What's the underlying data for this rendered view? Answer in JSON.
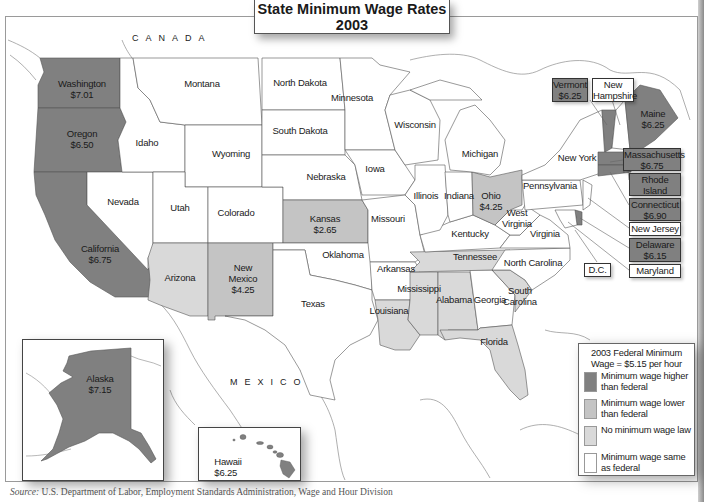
{
  "title": {
    "line1": "State Minimum Wage Rates",
    "line2": "2003"
  },
  "countries": {
    "canada": "CANADA",
    "mexico": "MEXICO"
  },
  "legend": {
    "heading_line1": "2003 Federal Minimum",
    "heading_line2": "Wage = $5.15 per hour",
    "items": [
      {
        "key": "higher",
        "label": "Minimum wage higher than federal",
        "color": "#808080"
      },
      {
        "key": "lower",
        "label": "Minimum wage lower than federal",
        "color": "#c4c4c4"
      },
      {
        "key": "none",
        "label": "No minimum wage law",
        "color": "#d9d9d9"
      },
      {
        "key": "same",
        "label": "Minimum wage same as federal",
        "color": "#ffffff"
      }
    ]
  },
  "states": [
    {
      "name": "Washington",
      "wage": "$7.01",
      "category": "higher"
    },
    {
      "name": "Oregon",
      "wage": "$6.50",
      "category": "higher"
    },
    {
      "name": "California",
      "wage": "$6.75",
      "category": "higher"
    },
    {
      "name": "Nevada",
      "wage": "",
      "category": "same"
    },
    {
      "name": "Idaho",
      "wage": "",
      "category": "same"
    },
    {
      "name": "Montana",
      "wage": "",
      "category": "same"
    },
    {
      "name": "Wyoming",
      "wage": "",
      "category": "same"
    },
    {
      "name": "Utah",
      "wage": "",
      "category": "same"
    },
    {
      "name": "Colorado",
      "wage": "",
      "category": "same"
    },
    {
      "name": "Arizona",
      "wage": "",
      "category": "none"
    },
    {
      "name": "New Mexico",
      "wage": "$4.25",
      "category": "lower"
    },
    {
      "name": "North Dakota",
      "wage": "",
      "category": "same"
    },
    {
      "name": "South Dakota",
      "wage": "",
      "category": "same"
    },
    {
      "name": "Nebraska",
      "wage": "",
      "category": "same"
    },
    {
      "name": "Kansas",
      "wage": "$2.65",
      "category": "lower"
    },
    {
      "name": "Oklahoma",
      "wage": "",
      "category": "same"
    },
    {
      "name": "Texas",
      "wage": "",
      "category": "same"
    },
    {
      "name": "Minnesota",
      "wage": "",
      "category": "same"
    },
    {
      "name": "Iowa",
      "wage": "",
      "category": "same"
    },
    {
      "name": "Missouri",
      "wage": "",
      "category": "same"
    },
    {
      "name": "Arkansas",
      "wage": "",
      "category": "same"
    },
    {
      "name": "Louisiana",
      "wage": "",
      "category": "none"
    },
    {
      "name": "Wisconsin",
      "wage": "",
      "category": "same"
    },
    {
      "name": "Illinois",
      "wage": "",
      "category": "same"
    },
    {
      "name": "Michigan",
      "wage": "",
      "category": "same"
    },
    {
      "name": "Indiana",
      "wage": "",
      "category": "same"
    },
    {
      "name": "Ohio",
      "wage": "$4.25",
      "category": "lower"
    },
    {
      "name": "Kentucky",
      "wage": "",
      "category": "same"
    },
    {
      "name": "Tennessee",
      "wage": "",
      "category": "none"
    },
    {
      "name": "Mississippi",
      "wage": "",
      "category": "none"
    },
    {
      "name": "Alabama",
      "wage": "",
      "category": "none"
    },
    {
      "name": "Georgia",
      "wage": "",
      "category": "same"
    },
    {
      "name": "Florida",
      "wage": "",
      "category": "none"
    },
    {
      "name": "South",
      "name2": "Carolina",
      "wage": "",
      "category": "none"
    },
    {
      "name": "North Carolina",
      "wage": "",
      "category": "same"
    },
    {
      "name": "Virginia",
      "wage": "",
      "category": "same"
    },
    {
      "name": "West",
      "name2": "Virginia",
      "wage": "",
      "category": "same"
    },
    {
      "name": "Pennsylvania",
      "wage": "",
      "category": "same"
    },
    {
      "name": "New York",
      "wage": "",
      "category": "same"
    },
    {
      "name": "Vermont",
      "wage": "$6.25",
      "category": "higher"
    },
    {
      "name": "New",
      "name2": "Hampshire",
      "wage": "",
      "category": "same"
    },
    {
      "name": "Maine",
      "wage": "$6.25",
      "category": "higher"
    },
    {
      "name": "Massachusetts",
      "wage": "$6.75",
      "category": "higher"
    },
    {
      "name": "Rhode Island",
      "wage": "$6.15",
      "category": "higher"
    },
    {
      "name": "Connecticut",
      "wage": "$6.90",
      "category": "higher"
    },
    {
      "name": "New Jersey",
      "wage": "",
      "category": "same"
    },
    {
      "name": "Delaware",
      "wage": "$6.15",
      "category": "higher"
    },
    {
      "name": "Maryland",
      "wage": "",
      "category": "same"
    },
    {
      "name": "D.C.",
      "wage": "",
      "category": "same"
    },
    {
      "name": "Alaska",
      "wage": "$7.15",
      "category": "higher"
    },
    {
      "name": "Hawaii",
      "wage": "$6.25",
      "category": "higher"
    }
  ],
  "extra_labels": {
    "new_mexico_line1": "New",
    "new_mexico_line2": "Mexico"
  },
  "source": {
    "prefix": "Source:",
    "text": " U.S. Department of Labor, Employment Standards Administration, Wage and Hour Division"
  }
}
